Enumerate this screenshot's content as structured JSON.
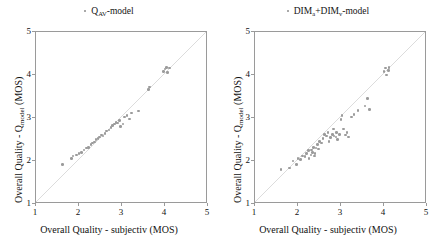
{
  "figure": {
    "background": "#ffffff",
    "marker_color": "#9b9b9b",
    "line_color": "#d8d8d8",
    "axis_color": "#9a9a9a"
  },
  "panels": [
    {
      "id": "left",
      "title_prefix_icon": "dot-marker-icon",
      "title_main": "Q",
      "title_sub": "AV",
      "title_suffix": "-model",
      "xlabel": "Overall Quality - subjectiv (MOS)",
      "ylabel_pre": "Overall Quality - Q",
      "ylabel_sub": "model",
      "ylabel_post": " (MOS)",
      "xticks": [
        "1",
        "2",
        "3",
        "4",
        "5"
      ],
      "yticks": [
        "1",
        "2",
        "3",
        "4",
        "5"
      ]
    },
    {
      "id": "right",
      "title_prefix_icon": "dot-marker-icon",
      "title_main": "DIM",
      "title_sub": "a",
      "title_main2": "+DIM",
      "title_sub2": "v",
      "title_suffix": "-model",
      "xlabel": "Overall Quality - subjectiv (MOS)",
      "ylabel_pre": "Overall Quality - Q",
      "ylabel_sub": "model",
      "ylabel_post": " (MOS)",
      "xticks": [
        "1",
        "2",
        "3",
        "4",
        "5"
      ],
      "yticks": [
        "1",
        "2",
        "3",
        "4",
        "5"
      ]
    }
  ],
  "chart_data": [
    {
      "type": "scatter",
      "title": "Q_AV-model",
      "xlabel": "Overall Quality - subjectiv (MOS)",
      "ylabel": "Overall Quality - Q_model (MOS)",
      "xlim": [
        1,
        5
      ],
      "ylim": [
        1,
        5
      ],
      "xticks": [
        1,
        2,
        3,
        4,
        5
      ],
      "yticks": [
        1,
        2,
        3,
        4,
        5
      ],
      "grid": false,
      "legend": "none",
      "reference_line": {
        "type": "identity",
        "from": [
          1,
          1
        ],
        "to": [
          5,
          5
        ]
      },
      "points": [
        [
          1.62,
          1.92
        ],
        [
          1.82,
          2.06
        ],
        [
          1.86,
          2.12
        ],
        [
          1.94,
          2.14
        ],
        [
          2.0,
          2.18
        ],
        [
          2.06,
          2.2
        ],
        [
          2.12,
          2.26
        ],
        [
          2.18,
          2.3
        ],
        [
          2.22,
          2.32
        ],
        [
          2.28,
          2.38
        ],
        [
          2.32,
          2.42
        ],
        [
          2.36,
          2.44
        ],
        [
          2.4,
          2.5
        ],
        [
          2.44,
          2.52
        ],
        [
          2.48,
          2.56
        ],
        [
          2.52,
          2.6
        ],
        [
          2.56,
          2.58
        ],
        [
          2.6,
          2.64
        ],
        [
          2.64,
          2.7
        ],
        [
          2.7,
          2.72
        ],
        [
          2.74,
          2.78
        ],
        [
          2.78,
          2.82
        ],
        [
          2.82,
          2.86
        ],
        [
          2.86,
          2.9
        ],
        [
          2.9,
          2.88
        ],
        [
          2.94,
          2.94
        ],
        [
          2.96,
          2.8
        ],
        [
          3.02,
          2.86
        ],
        [
          3.06,
          3.02
        ],
        [
          3.12,
          3.06
        ],
        [
          3.18,
          2.98
        ],
        [
          3.22,
          3.12
        ],
        [
          3.38,
          3.16
        ],
        [
          3.62,
          3.66
        ],
        [
          3.64,
          3.72
        ],
        [
          3.96,
          4.08
        ],
        [
          4.0,
          4.14
        ],
        [
          4.04,
          4.18
        ],
        [
          4.06,
          4.06
        ],
        [
          4.1,
          4.16
        ]
      ]
    },
    {
      "type": "scatter",
      "title": "DIM_a+DIM_v-model",
      "xlabel": "Overall Quality - subjectiv (MOS)",
      "ylabel": "Overall Quality - Q_model (MOS)",
      "xlim": [
        1,
        5
      ],
      "ylim": [
        1,
        5
      ],
      "xticks": [
        1,
        2,
        3,
        4,
        5
      ],
      "yticks": [
        1,
        2,
        3,
        4,
        5
      ],
      "grid": false,
      "legend": "none",
      "reference_line": {
        "type": "identity",
        "from": [
          1,
          1
        ],
        "to": [
          5,
          5
        ]
      },
      "points": [
        [
          1.6,
          1.8
        ],
        [
          1.8,
          1.84
        ],
        [
          1.88,
          2.0
        ],
        [
          1.96,
          1.92
        ],
        [
          2.0,
          2.06
        ],
        [
          2.06,
          2.04
        ],
        [
          2.1,
          2.12
        ],
        [
          2.16,
          2.1
        ],
        [
          2.2,
          2.18
        ],
        [
          2.24,
          2.24
        ],
        [
          2.26,
          2.06
        ],
        [
          2.3,
          2.14
        ],
        [
          2.32,
          2.26
        ],
        [
          2.34,
          2.2
        ],
        [
          2.36,
          2.32
        ],
        [
          2.38,
          2.12
        ],
        [
          2.4,
          2.18
        ],
        [
          2.42,
          2.3
        ],
        [
          2.46,
          2.38
        ],
        [
          2.48,
          2.28
        ],
        [
          2.5,
          2.46
        ],
        [
          2.54,
          2.42
        ],
        [
          2.58,
          2.52
        ],
        [
          2.62,
          2.62
        ],
        [
          2.66,
          2.58
        ],
        [
          2.7,
          2.66
        ],
        [
          2.72,
          2.46
        ],
        [
          2.76,
          2.54
        ],
        [
          2.8,
          2.62
        ],
        [
          2.82,
          2.74
        ],
        [
          2.84,
          2.58
        ],
        [
          2.88,
          2.56
        ],
        [
          2.9,
          2.66
        ],
        [
          2.92,
          2.5
        ],
        [
          2.96,
          2.62
        ],
        [
          3.0,
          2.96
        ],
        [
          3.02,
          3.06
        ],
        [
          3.06,
          2.74
        ],
        [
          3.1,
          2.6
        ],
        [
          3.14,
          2.66
        ],
        [
          3.18,
          2.56
        ],
        [
          3.24,
          3.02
        ],
        [
          3.3,
          3.08
        ],
        [
          3.4,
          3.18
        ],
        [
          3.56,
          3.28
        ],
        [
          3.62,
          3.46
        ],
        [
          3.66,
          3.2
        ],
        [
          4.0,
          4.08
        ],
        [
          4.04,
          4.16
        ],
        [
          4.06,
          4.0
        ],
        [
          4.1,
          4.1
        ],
        [
          4.12,
          4.18
        ]
      ]
    }
  ]
}
